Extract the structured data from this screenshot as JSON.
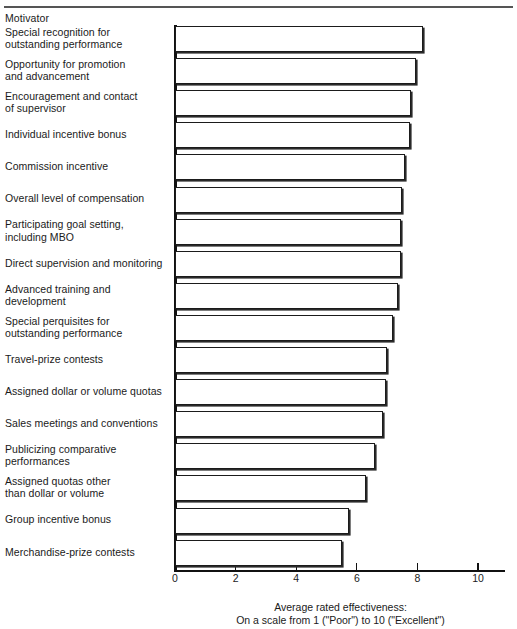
{
  "figure": {
    "title_remnant": "",
    "column_header": "Motivator"
  },
  "chart_data": {
    "type": "bar",
    "orientation": "horizontal",
    "title": "",
    "xlabel": "Average rated effectiveness: On a scale from 1 (\"Poor\") to 10 (\"Excellent\")",
    "ylabel": "Motivator",
    "xlim": [
      0,
      11
    ],
    "xticks": [
      0,
      2,
      4,
      6,
      8,
      10
    ],
    "xtick_labels": [
      "0",
      "2",
      "4",
      "6",
      "8",
      "10"
    ],
    "grid": false,
    "legend": null,
    "categories": [
      "Special recognition for outstanding performance",
      "Opportunity for promotion and advancement",
      "Encouragement and contact of supervisor",
      "Individual incentive bonus",
      "Commission incentive",
      "Overall level of compensation",
      "Participating goal setting, including MBO",
      "Direct supervision and monitoring",
      "Advanced training and development",
      "Special perquisites for outstanding performance",
      "Travel-prize contests",
      "Assigned dollar or volume quotas",
      "Sales meetings and conventions",
      "Publicizing comparative performances",
      "Assigned quotas other than dollar or volume",
      "Group incentive bonus",
      "Merchandise-prize contests"
    ],
    "values": [
      8.2,
      7.95,
      7.8,
      7.75,
      7.6,
      7.5,
      7.45,
      7.45,
      7.35,
      7.2,
      7.0,
      6.95,
      6.85,
      6.6,
      6.3,
      5.75,
      5.5
    ]
  },
  "labels": [
    {
      "lines": [
        "Special recognition for",
        "outstanding performance"
      ]
    },
    {
      "lines": [
        "Opportunity for promotion",
        "and advancement"
      ]
    },
    {
      "lines": [
        "Encouragement and contact",
        "of supervisor"
      ]
    },
    {
      "lines": [
        "Individual incentive bonus"
      ]
    },
    {
      "lines": [
        "Commission incentive"
      ]
    },
    {
      "lines": [
        "Overall level of compensation"
      ]
    },
    {
      "lines": [
        "Participating goal setting,",
        "including MBO"
      ]
    },
    {
      "lines": [
        "Direct supervision and monitoring"
      ]
    },
    {
      "lines": [
        "Advanced training and",
        "development"
      ]
    },
    {
      "lines": [
        "Special perquisites for",
        "outstanding performance"
      ]
    },
    {
      "lines": [
        "Travel-prize contests"
      ]
    },
    {
      "lines": [
        "Assigned dollar or volume quotas"
      ]
    },
    {
      "lines": [
        "Sales meetings and conventions"
      ]
    },
    {
      "lines": [
        "Publicizing comparative",
        "performances"
      ]
    },
    {
      "lines": [
        "Assigned quotas other",
        "than dollar or volume"
      ]
    },
    {
      "lines": [
        "Group incentive bonus"
      ]
    },
    {
      "lines": [
        "Merchandise-prize contests"
      ]
    }
  ],
  "caption": {
    "line1": "Average rated effectiveness:",
    "line2": "On a scale from 1 (\"Poor\") to 10 (\"Excellent\")"
  }
}
